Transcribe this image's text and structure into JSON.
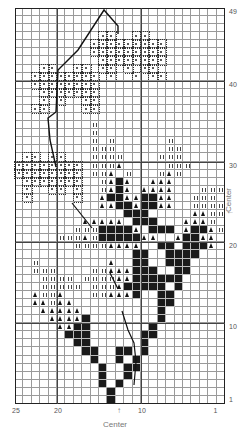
{
  "chart": {
    "columns": 25,
    "rows": 49,
    "legend_symbols": {
      ".": "empty",
      "o": "dotted-flower-stitch",
      "X": "solid-black-stitch",
      "t": "triangle-stitch",
      "i": "double-tick-stitch"
    },
    "grid": [
      ".........................",
      ".........................",
      ".........................",
      "..........oo..oo.........",
      ".........ooooooooo.......",
      ".........ooooooooo.......",
      "..........oooooooo.......",
      "...oo..oo.oo.o.oo........",
      "..oooooooo.o..o.oo.......",
      "..oooooooo...............",
      "...ooooooo...............",
      "...o.o..oo...............",
      "..oo....oo...............",
      ".........................",
      ".........i...............",
      ".........i...............",
      ".........i.i......i......",
      ".........iii......ii.....",
      ".oo.oo...iiii....iii.....",
      "oooooooo.iiit.....iii....",
      "oooooooo.iit.i...iti.....",
      ".ooooooo..itXt..ttt......",
      ".o..oo.o..itXt.tttt...iii",
      ".o.....o..tXXttXXtt..iii.",
      "..........ttXXtXXtt..iiii",
      ".............XXX.....ttii",
      "........ttttt.XXX...ttti.",
      ".......iiiXXXXt.XXX.tXXti",
      ".....iiitiXXXXXtt..tXXtt.",
      ".......iiiitttt..XX.XXXt.",
      "..............XX..XXXX...",
      "..i........t..XX..XXX....",
      "..iii....iitttXXX..XX....",
      "...iiii.iiiittXXXXXX.....",
      "...iiiii.iiitXXXXX.X.....",
      "..tiit...iitttX..XX......",
      "..ttitt..........XX......",
      "...ttttt.........X.......",
      "....ttttX........X.......",
      ".....ttXX.......X........",
      "......XXX......XX........",
      ".......XX......X.........",
      "........XX..XX.X.........",
      ".........X..X.X..........",
      "..........X..XX..........",
      "..........X..X...........",
      "..........X.X............",
      "...........X.............",
      "...........X............."
    ]
  },
  "labels": {
    "right": [
      {
        "text": "49",
        "row": 49
      },
      {
        "text": "40",
        "row": 40
      },
      {
        "text": "30",
        "row": 30
      },
      {
        "text": "20",
        "row": 20
      },
      {
        "text": "10",
        "row": 10
      },
      {
        "text": "1",
        "row": 1
      }
    ],
    "bottom": [
      {
        "text": "25",
        "col": 25
      },
      {
        "text": "20",
        "col": 20
      },
      {
        "text": "10",
        "col": 10
      },
      {
        "text": "1",
        "col": 1
      }
    ],
    "center_bottom": "Center",
    "center_right": "Center",
    "arrow": "↑",
    "arrow_right": "←"
  }
}
